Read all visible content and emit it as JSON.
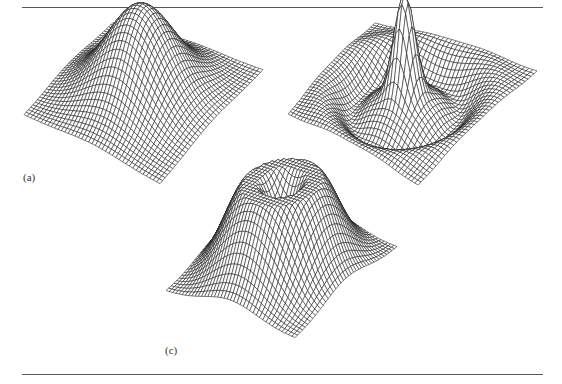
{
  "figure": {
    "rules": {
      "color": "#5a5a5a",
      "top_y": 7,
      "bottom_y": 374,
      "x_start": 22,
      "x_end": 543
    },
    "panels": [
      {
        "id": "a",
        "label": "(a)",
        "label_pos": [
          23,
          171
        ],
        "surface": "gaussian",
        "description": "Gaussian bump surface (mesh plot)",
        "grid": 40,
        "corners": {
          "back": [
            113,
            23
          ],
          "right": [
            263,
            70
          ],
          "front": [
            160,
            184
          ],
          "left": [
            24,
            115
          ]
        },
        "peak_height": 92,
        "line_color": "#1a1a1a"
      },
      {
        "id": "b",
        "label": "(b)",
        "label_pos": [
          285,
          170
        ],
        "surface": "mexican_hat",
        "description": "Laplacian-of-Gaussian / sinc-like surface with sharp central peak and ring",
        "grid": 40,
        "corners": {
          "back": [
            375,
            23
          ],
          "right": [
            537,
            71
          ],
          "front": [
            418,
            185
          ],
          "left": [
            288,
            114
          ]
        },
        "peak_height": 105,
        "line_color": "#1a1a1a"
      },
      {
        "id": "c",
        "label": "(c)",
        "label_pos": [
          165,
          344
        ],
        "surface": "ring",
        "description": "Volcano-shaped ring surface with crater at center",
        "grid": 40,
        "corners": {
          "back": [
            270,
            206
          ],
          "right": [
            397,
            247
          ],
          "front": [
            295,
            338
          ],
          "left": [
            166,
            291
          ]
        },
        "peak_height": 88,
        "line_color": "#1a1a1a"
      }
    ]
  }
}
